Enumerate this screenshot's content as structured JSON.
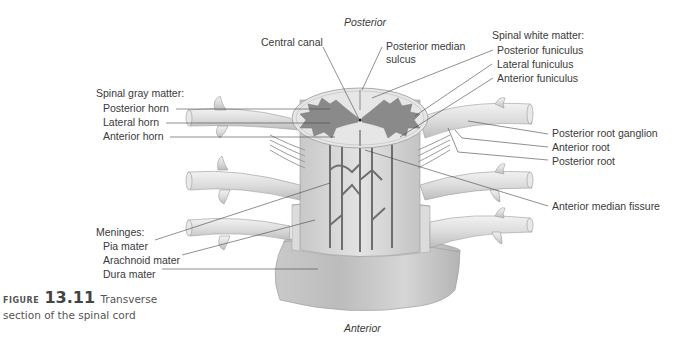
{
  "orientation": {
    "top": "Posterior",
    "bottom": "Anterior"
  },
  "labels": {
    "central_canal": "Central canal",
    "posterior_median_sulcus_line1": "Posterior median",
    "posterior_median_sulcus_line2": "sulcus",
    "anterior_median_fissure": "Anterior median fissure"
  },
  "spinal_gray_matter": {
    "heading": "Spinal gray matter:",
    "items": [
      "Posterior horn",
      "Lateral horn",
      "Anterior horn"
    ]
  },
  "spinal_white_matter": {
    "heading": "Spinal white matter:",
    "items": [
      "Posterior funiculus",
      "Lateral funiculus",
      "Anterior funiculus"
    ]
  },
  "roots": {
    "items": [
      "Posterior root ganglion",
      "Anterior root",
      "Posterior root"
    ]
  },
  "meninges": {
    "heading": "Meninges:",
    "items": [
      "Pia mater",
      "Arachnoid mater",
      "Dura mater"
    ]
  },
  "caption": {
    "prefix": "FIGURE",
    "number": "13.11",
    "title_line1": "Transverse",
    "title_line2": "section of the spinal cord"
  },
  "colors": {
    "gray_matter": "#8a8a8a",
    "white_matter": "#e6e6e6",
    "tissue": "#cfcfcf",
    "dura": "#bdbdbd",
    "leader_line": "#444444"
  }
}
